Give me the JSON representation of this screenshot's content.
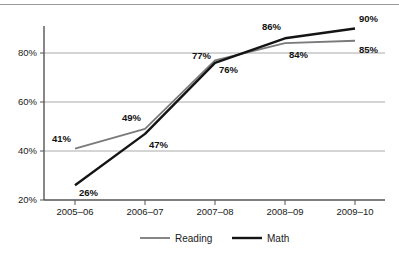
{
  "chart_data": {
    "type": "line",
    "title": "",
    "subtitle": "",
    "xlabel": "",
    "ylabel": "",
    "categories": [
      "2005–06",
      "2006–07",
      "2007–08",
      "2008–09",
      "2009–10"
    ],
    "series": [
      {
        "name": "Reading",
        "color": "#7a7a7a",
        "values": [
          41,
          49,
          77,
          84,
          85
        ],
        "value_labels": [
          "41%",
          "49%",
          "77%",
          "84%",
          "85%"
        ],
        "label_positions": [
          "left",
          "above-left",
          "above-left",
          "below-right",
          "below-right"
        ]
      },
      {
        "name": "Math",
        "color": "#141414",
        "values": [
          26,
          47,
          76,
          86,
          90
        ],
        "value_labels": [
          "26%",
          "47%",
          "76%",
          "86%",
          "90%"
        ],
        "label_positions": [
          "below-right",
          "below-right",
          "below-right",
          "above-left",
          "above-right"
        ]
      }
    ],
    "ylim": [
      20,
      95
    ],
    "ytick_values": [
      20,
      40,
      60,
      80
    ],
    "ytick_labels": [
      "20%",
      "40%",
      "60%",
      "80%"
    ],
    "grid": true,
    "grid_axis": "y",
    "legend_position": "bottom",
    "legend_entries": [
      {
        "label": "Reading",
        "color": "#7a7a7a"
      },
      {
        "label": "Math",
        "color": "#141414"
      }
    ],
    "axis_color": "#555555",
    "grid_color": "#aaaaaa"
  }
}
